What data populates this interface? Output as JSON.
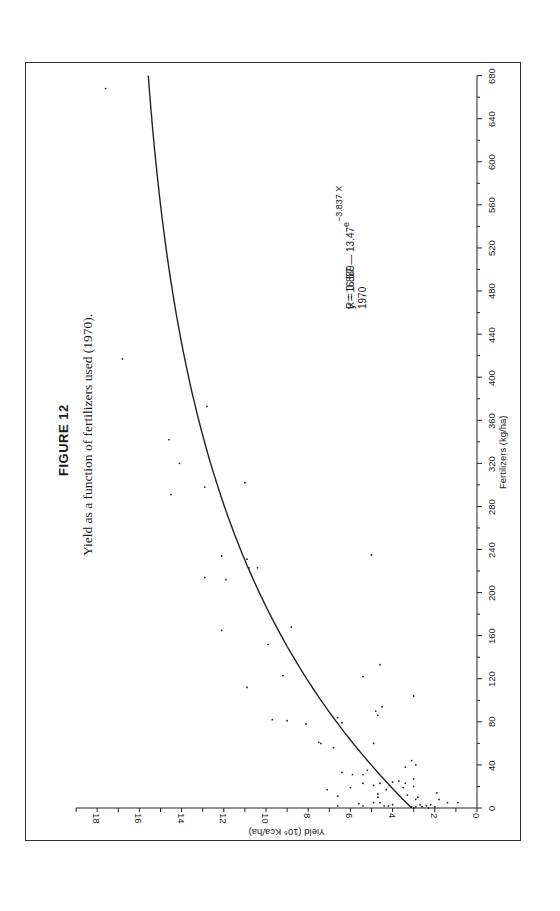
{
  "figure": {
    "number_label": "FIGURE 12",
    "caption": "Yield as a function of fertilizers used (1970)."
  },
  "annotation": {
    "equation_main": "y = 16.57 — 13.47",
    "equation_base": "e",
    "equation_exponent": "−3.837 X",
    "r_value": "R = 0.889",
    "year": "1970"
  },
  "chart_data": {
    "type": "scatter",
    "orientation_note": "figure printed rotated 90° counter-clockwise",
    "xlabel": "Fertilizers (kg/ha)",
    "ylabel": "Yield (10⁶ Kca/ha)",
    "xlim": [
      0,
      680
    ],
    "ylim": [
      0,
      19
    ],
    "x_ticks": [
      0,
      40,
      80,
      120,
      160,
      200,
      240,
      280,
      320,
      360,
      400,
      440,
      480,
      520,
      560,
      600,
      640,
      680
    ],
    "y_ticks": [
      0,
      2,
      4,
      6,
      8,
      10,
      12,
      14,
      16,
      18
    ],
    "grid": false,
    "legend": null,
    "fit_curve": {
      "label": "y = 16.57 − 13.47e^(−3.837 X)",
      "a": 16.57,
      "b": 13.47,
      "k_per_kg": 0.003837,
      "R": 0.889,
      "year": "1970"
    },
    "series": [
      {
        "name": "Countries 1970",
        "points": [
          [
            668,
            17.6
          ],
          [
            417,
            16.8
          ],
          [
            373,
            12.8
          ],
          [
            342,
            14.6
          ],
          [
            320,
            14.1
          ],
          [
            302,
            11.0
          ],
          [
            298,
            12.9
          ],
          [
            291,
            14.5
          ],
          [
            235,
            5.0
          ],
          [
            234,
            12.1
          ],
          [
            231,
            10.9
          ],
          [
            223,
            10.8
          ],
          [
            223,
            10.4
          ],
          [
            214,
            12.9
          ],
          [
            212,
            11.9
          ],
          [
            168,
            8.8
          ],
          [
            165,
            12.1
          ],
          [
            152,
            9.9
          ],
          [
            133,
            4.6
          ],
          [
            123,
            9.2
          ],
          [
            122,
            5.4
          ],
          [
            112,
            10.9
          ],
          [
            104,
            3.0
          ],
          [
            94,
            4.5
          ],
          [
            90,
            4.8
          ],
          [
            86,
            4.7
          ],
          [
            84,
            6.6
          ],
          [
            82,
            9.7
          ],
          [
            81,
            9.0
          ],
          [
            79,
            6.4
          ],
          [
            78,
            8.1
          ],
          [
            61,
            7.5
          ],
          [
            60,
            7.4
          ],
          [
            60,
            4.9
          ],
          [
            56,
            6.8
          ],
          [
            44,
            3.1
          ],
          [
            40,
            2.9
          ],
          [
            38,
            3.4
          ],
          [
            35,
            5.2
          ],
          [
            33,
            6.4
          ],
          [
            31,
            5.9
          ],
          [
            31,
            5.4
          ],
          [
            27,
            3.0
          ],
          [
            25,
            3.7
          ],
          [
            24,
            4.0
          ],
          [
            23,
            5.4
          ],
          [
            23,
            3.4
          ],
          [
            23,
            4.6
          ],
          [
            21,
            4.9
          ],
          [
            20,
            3.0
          ],
          [
            19,
            6.0
          ],
          [
            19,
            3.5
          ],
          [
            17,
            7.1
          ],
          [
            17,
            4.3
          ],
          [
            14,
            1.9
          ],
          [
            13,
            4.7
          ],
          [
            12,
            3.3
          ],
          [
            11,
            6.6
          ],
          [
            10,
            4.7
          ],
          [
            10,
            2.8
          ],
          [
            8,
            2.9
          ],
          [
            8,
            1.8
          ],
          [
            5,
            4.9
          ],
          [
            5,
            4.6
          ],
          [
            5,
            1.4
          ],
          [
            5,
            0.9
          ],
          [
            4,
            5.6
          ],
          [
            3,
            4.0
          ],
          [
            3,
            2.2
          ],
          [
            3,
            2.7
          ],
          [
            2,
            6.6
          ],
          [
            2,
            5.4
          ],
          [
            2,
            4.4
          ],
          [
            2,
            4.2
          ],
          [
            1,
            2.9
          ],
          [
            1,
            2.6
          ],
          [
            1,
            3.1
          ],
          [
            2,
            2.4
          ],
          [
            1,
            2.0
          ],
          [
            0,
            3.0
          ],
          [
            0,
            2.3
          ]
        ]
      }
    ]
  }
}
